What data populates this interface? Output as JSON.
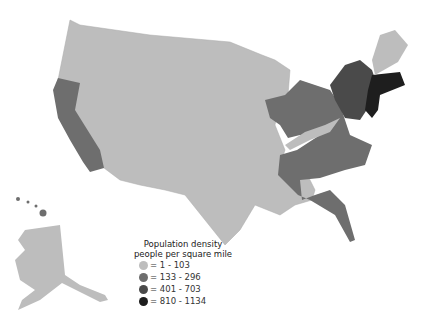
{
  "legend": {
    "title_line1": "Population density",
    "title_line2": "people per square mile",
    "items": [
      {
        "label": "= 1 - 103",
        "color": "#bdbdbd"
      },
      {
        "label": "= 133 - 296",
        "color": "#6e6e6e"
      },
      {
        "label": "= 401 - 703",
        "color": "#4a4a4a"
      },
      {
        "label": "= 810 - 1134",
        "color": "#1e1e1e"
      }
    ]
  },
  "colors": {
    "light": "#bdbdbd",
    "mid": "#6e6e6e",
    "dark": "#4a4a4a",
    "darkest": "#1e1e1e"
  }
}
